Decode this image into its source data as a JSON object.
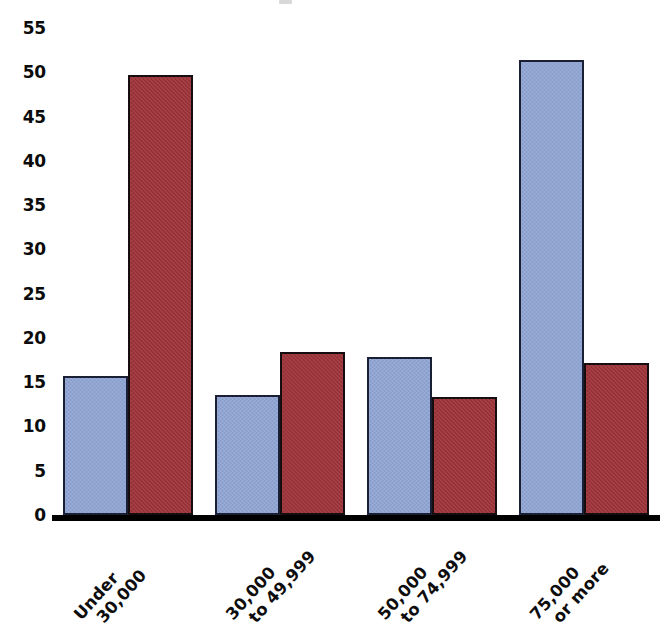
{
  "chart_data": {
    "type": "bar",
    "title": "",
    "subtitle": "",
    "xlabel": "",
    "ylabel": "",
    "categories": [
      "Under 30,000",
      "30,000 to 49,999",
      "50,000 to 74,999",
      "75,000 or more"
    ],
    "category_lines": [
      [
        "Under",
        "30,000"
      ],
      [
        "30,000",
        "to 49,999"
      ],
      [
        "50,000",
        "to 74,999"
      ],
      [
        "75,000",
        "or more"
      ]
    ],
    "series": [
      {
        "name": "Series 1",
        "color": "#8fa4d3",
        "values": [
          15.7,
          13.6,
          17.9,
          51.4
        ]
      },
      {
        "name": "Series 2",
        "color": "#9e3439",
        "values": [
          49.7,
          18.4,
          13.3,
          17.2
        ]
      }
    ],
    "ylim": [
      0,
      55
    ],
    "yticks": [
      0,
      5,
      10,
      15,
      20,
      25,
      30,
      35,
      40,
      45,
      50,
      55
    ],
    "ytick_labels": [
      "0",
      "5",
      "10",
      "15",
      "20",
      "25",
      "30",
      "35",
      "40",
      "45",
      "50",
      "55"
    ],
    "grid": false,
    "legend": "none",
    "axis_line_color": "#000000",
    "bar_outline_color": "#141414",
    "background": "#ffffff",
    "xtick_rotation_degrees": -48
  },
  "axes": {
    "y_axis_name": "y-axis",
    "x_axis_name": "x-axis"
  }
}
